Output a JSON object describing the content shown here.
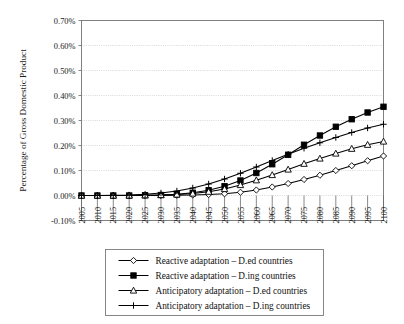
{
  "chart_data": {
    "type": "line",
    "title": "",
    "xlabel": "",
    "ylabel": "Percentage of Gross Domestic Product",
    "xlim": [
      2005,
      2100
    ],
    "ylim": [
      -0.1,
      0.7
    ],
    "ytick_labels": [
      "0.70%",
      "0.60%",
      "0.50%",
      "0.40%",
      "0.30%",
      "0.20%",
      "0.10%",
      "0.00%",
      "-0.10%"
    ],
    "ytick_values": [
      0.7,
      0.6,
      0.5,
      0.4,
      0.3,
      0.2,
      0.1,
      0.0,
      -0.1
    ],
    "grid": true,
    "legend_position": "bottom",
    "categories": [
      2005,
      2010,
      2015,
      2020,
      2025,
      2030,
      2035,
      2040,
      2045,
      2050,
      2055,
      2060,
      2065,
      2070,
      2075,
      2080,
      2085,
      2090,
      2095,
      2100
    ],
    "series": [
      {
        "name": "Reactive adaptation  – D.ed countries",
        "marker": "open-diamond",
        "values": [
          0.0,
          0.0,
          0.0,
          0.0,
          0.0,
          0.0,
          0.001,
          0.002,
          0.004,
          0.007,
          0.013,
          0.022,
          0.034,
          0.048,
          0.064,
          0.081,
          0.1,
          0.119,
          0.139,
          0.158
        ]
      },
      {
        "name": "Reactive adaptation  – D.ing countries",
        "marker": "filled-square",
        "values": [
          0.0,
          0.0,
          0.0,
          0.0,
          0.001,
          0.002,
          0.005,
          0.011,
          0.021,
          0.037,
          0.06,
          0.09,
          0.125,
          0.163,
          0.203,
          0.24,
          0.275,
          0.305,
          0.332,
          0.355
        ]
      },
      {
        "name": "Anticipatory adaptation  – D.ed countries",
        "marker": "open-triangle",
        "values": [
          0.0,
          0.0,
          0.0,
          0.0,
          0.001,
          0.002,
          0.004,
          0.008,
          0.015,
          0.026,
          0.042,
          0.061,
          0.082,
          0.104,
          0.127,
          0.148,
          0.168,
          0.187,
          0.203,
          0.216
        ]
      },
      {
        "name": "Anticipatory adaptation  – D.ing countries",
        "marker": "plus",
        "values": [
          0.0,
          0.0,
          0.001,
          0.002,
          0.005,
          0.01,
          0.018,
          0.03,
          0.046,
          0.066,
          0.089,
          0.114,
          0.14,
          0.165,
          0.189,
          0.211,
          0.232,
          0.252,
          0.27,
          0.285
        ]
      }
    ]
  },
  "legend": {
    "items": [
      {
        "label": "Reactive adaptation  – D.ed countries",
        "marker": "open-diamond"
      },
      {
        "label": "Reactive adaptation  – D.ing countries",
        "marker": "filled-square"
      },
      {
        "label": "Anticipatory adaptation  – D.ed countries",
        "marker": "open-triangle"
      },
      {
        "label": "Anticipatory adaptation  – D.ing countries",
        "marker": "plus"
      }
    ]
  },
  "colors": {
    "line": "#000000",
    "grid": "#c8c8c8",
    "axis": "#808080",
    "background": "#ffffff"
  }
}
